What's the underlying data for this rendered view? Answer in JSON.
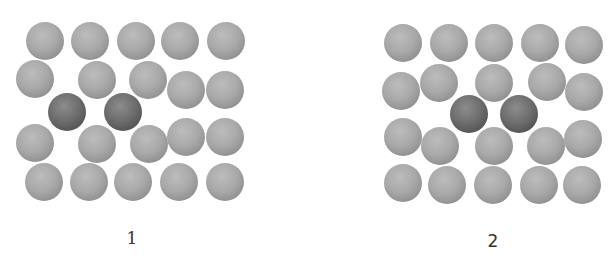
{
  "diagrams": [
    {
      "label": "1",
      "label_pos": [
        132,
        238
      ],
      "spheres": [
        {
          "x": 45,
          "y": 41,
          "type": "host"
        },
        {
          "x": 90,
          "y": 41,
          "type": "host"
        },
        {
          "x": 136,
          "y": 41,
          "type": "host"
        },
        {
          "x": 180,
          "y": 41,
          "type": "host"
        },
        {
          "x": 226,
          "y": 41,
          "type": "host"
        },
        {
          "x": 35,
          "y": 79,
          "type": "host"
        },
        {
          "x": 97,
          "y": 80,
          "type": "host"
        },
        {
          "x": 148,
          "y": 80,
          "type": "host"
        },
        {
          "x": 186,
          "y": 90,
          "type": "host"
        },
        {
          "x": 225,
          "y": 90,
          "type": "host"
        },
        {
          "x": 67,
          "y": 112,
          "type": "solute"
        },
        {
          "x": 123,
          "y": 112,
          "type": "solute"
        },
        {
          "x": 35,
          "y": 143,
          "type": "host"
        },
        {
          "x": 97,
          "y": 144,
          "type": "host"
        },
        {
          "x": 149,
          "y": 144,
          "type": "host"
        },
        {
          "x": 186,
          "y": 137,
          "type": "host"
        },
        {
          "x": 225,
          "y": 137,
          "type": "host"
        },
        {
          "x": 44,
          "y": 182,
          "type": "host"
        },
        {
          "x": 89,
          "y": 182,
          "type": "host"
        },
        {
          "x": 133,
          "y": 182,
          "type": "host"
        },
        {
          "x": 179,
          "y": 182,
          "type": "host"
        },
        {
          "x": 225,
          "y": 182,
          "type": "host"
        }
      ]
    },
    {
      "label": "2",
      "label_pos": [
        493,
        241
      ],
      "spheres": [
        {
          "x": 403,
          "y": 43,
          "type": "host"
        },
        {
          "x": 449,
          "y": 43,
          "type": "host"
        },
        {
          "x": 494,
          "y": 43,
          "type": "host"
        },
        {
          "x": 540,
          "y": 43,
          "type": "host"
        },
        {
          "x": 584,
          "y": 45,
          "type": "host"
        },
        {
          "x": 401,
          "y": 91,
          "type": "host"
        },
        {
          "x": 439,
          "y": 83,
          "type": "host"
        },
        {
          "x": 494,
          "y": 83,
          "type": "host"
        },
        {
          "x": 547,
          "y": 82,
          "type": "host"
        },
        {
          "x": 584,
          "y": 92,
          "type": "host"
        },
        {
          "x": 469,
          "y": 114,
          "type": "solute"
        },
        {
          "x": 519,
          "y": 114,
          "type": "solute"
        },
        {
          "x": 403,
          "y": 137,
          "type": "host"
        },
        {
          "x": 440,
          "y": 146,
          "type": "host"
        },
        {
          "x": 494,
          "y": 146,
          "type": "host"
        },
        {
          "x": 546,
          "y": 146,
          "type": "host"
        },
        {
          "x": 583,
          "y": 139,
          "type": "host"
        },
        {
          "x": 403,
          "y": 183,
          "type": "host"
        },
        {
          "x": 447,
          "y": 185,
          "type": "host"
        },
        {
          "x": 493,
          "y": 185,
          "type": "host"
        },
        {
          "x": 539,
          "y": 185,
          "type": "host"
        },
        {
          "x": 582,
          "y": 185,
          "type": "host"
        }
      ]
    }
  ],
  "colors": {
    "host": "#a9a9a9",
    "solute": "#5a5a5a",
    "background": "#ffffff"
  }
}
